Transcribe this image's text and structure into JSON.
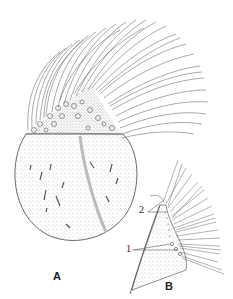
{
  "figure": {
    "panels": [
      {
        "id": "A",
        "label": "A",
        "description": "Whole ciliate organism with crown of cilia and granular apical region"
      },
      {
        "id": "B",
        "label": "B",
        "description": "Detail of apical region with cilia rows and basal granules"
      }
    ],
    "annotations": [
      {
        "label": "2",
        "panel": "B"
      },
      {
        "label": "1",
        "panel": "B"
      }
    ],
    "colors": {
      "ink": "#3a3a3a",
      "stipple": "#9a9a9a",
      "background": "#ffffff"
    }
  }
}
